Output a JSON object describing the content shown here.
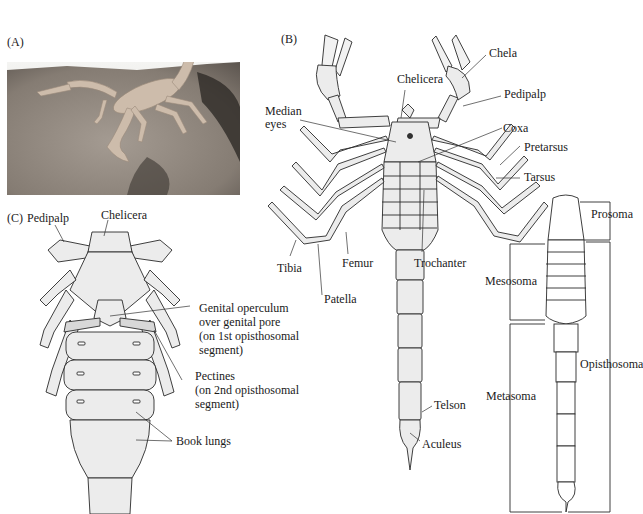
{
  "figure": {
    "panels": [
      {
        "id": "A",
        "label": "(A)",
        "type": "photograph"
      },
      {
        "id": "B",
        "label": "(B)",
        "type": "dorsal illustration"
      },
      {
        "id": "C",
        "label": "(C)",
        "type": "ventral illustration"
      },
      {
        "id": "D",
        "label": "",
        "type": "body regions outline"
      }
    ]
  },
  "panel_a": {
    "label": "(A)"
  },
  "panel_b": {
    "label": "(B)",
    "labels": {
      "chela": "Chela",
      "chelicera": "Chelicera",
      "pedipalp": "Pedipalp",
      "median_eyes_1": "Median",
      "median_eyes_2": "eyes",
      "coxa": "Coxa",
      "pretarsus": "Pretarsus",
      "tarsus": "Tarsus",
      "tibia": "Tibia",
      "femur": "Femur",
      "patella": "Patella",
      "trochanter": "Trochanter",
      "telson": "Telson",
      "aculeus": "Aculeus"
    }
  },
  "panel_c": {
    "label": "(C)",
    "labels": {
      "pedipalp": "Pedipalp",
      "chelicera": "Chelicera",
      "genital_1": "Genital operculum",
      "genital_2": "over genital pore",
      "genital_3": "(on 1st opisthosomal",
      "genital_4": "segment)",
      "pectines_1": "Pectines",
      "pectines_2": "(on 2nd opisthosomal",
      "pectines_3": "segment)",
      "book_lungs": "Book lungs"
    }
  },
  "panel_d": {
    "labels": {
      "prosoma": "Prosoma",
      "mesosoma": "Mesosoma",
      "opisthosoma": "Opisthosoma",
      "metasoma": "Metasoma"
    }
  },
  "colors": {
    "line": "#2a2a2a",
    "photo_ground": "#8a8178",
    "photo_sky": "#f4f4f2",
    "scorpion_photo": "#c9b9a8",
    "illustration_fill": "#ececec"
  }
}
